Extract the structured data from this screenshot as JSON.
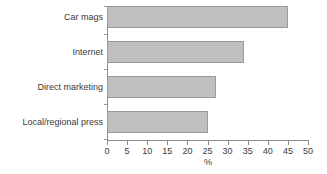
{
  "chart_data": {
    "type": "bar",
    "orientation": "horizontal",
    "title": "",
    "xlabel": "%",
    "ylabel": "",
    "categories": [
      "Car mags",
      "Internet",
      "Direct marketing",
      "Local/regional press"
    ],
    "values": [
      45,
      34,
      27,
      25
    ],
    "xlim": [
      0,
      50
    ],
    "xticks": [
      0,
      5,
      10,
      15,
      20,
      25,
      30,
      35,
      40,
      45,
      50
    ],
    "xtick_labels": [
      "0",
      "5",
      "10",
      "15",
      "20",
      "25",
      "30",
      "35",
      "40",
      "45",
      "50"
    ],
    "grid": false,
    "legend": false,
    "series": [
      {
        "name": "",
        "values": [
          45,
          34,
          27,
          25
        ]
      }
    ],
    "colors": {
      "bar_fill": "#bfbfbf",
      "bar_border": "#9a9a9a",
      "axis": "#8c8c8c",
      "text": "#3a3a3a",
      "background": "#ffffff"
    }
  }
}
